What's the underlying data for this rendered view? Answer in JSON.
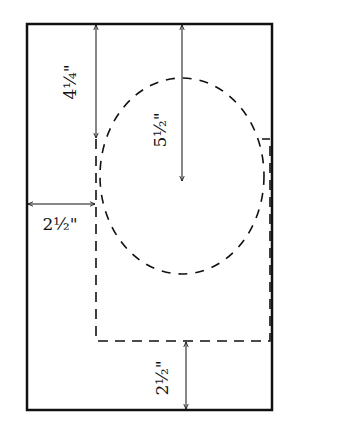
{
  "diagram": {
    "title": "",
    "labels": {
      "top_margin": "4¼\"",
      "oval_height": "5½\"",
      "left_margin": "2½\"",
      "bottom_margin": "2½\""
    },
    "colors": {
      "line": "#111111",
      "background": "#ffffff"
    }
  }
}
